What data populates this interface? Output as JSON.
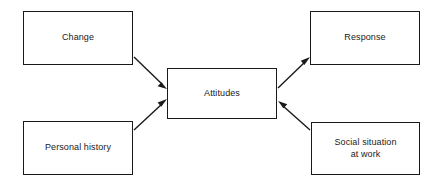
{
  "diagram": {
    "canvas": {
      "width": 443,
      "height": 184,
      "background": "#ffffff"
    },
    "style": {
      "box_border_color": "#1a1a1a",
      "box_fill": "#ffffff",
      "text_color": "#1a1a1a",
      "arrow_color": "#1a1a1a"
    },
    "nodes": [
      {
        "id": "change",
        "label": "Change",
        "x": 23,
        "y": 11,
        "width": 110,
        "height": 54
      },
      {
        "id": "personal_history",
        "label": "Personal history",
        "x": 23,
        "y": 121,
        "width": 110,
        "height": 54
      },
      {
        "id": "attitudes",
        "label": "Attitudes",
        "x": 167,
        "y": 68,
        "width": 110,
        "height": 51
      },
      {
        "id": "response",
        "label": "Response",
        "x": 310,
        "y": 11,
        "width": 110,
        "height": 54
      },
      {
        "id": "social_situation",
        "label": "Social situation\nat work",
        "x": 311,
        "y": 122,
        "width": 109,
        "height": 53
      }
    ],
    "edges": [
      {
        "id": "change-to-attitudes",
        "from": "change",
        "to": "attitudes",
        "label": ""
      },
      {
        "id": "personal-history-to-attitudes",
        "from": "personal_history",
        "to": "attitudes",
        "label": ""
      },
      {
        "id": "attitudes-to-response",
        "from": "attitudes",
        "to": "response",
        "label": ""
      },
      {
        "id": "social-situation-to-attitudes",
        "from": "social_situation",
        "to": "attitudes",
        "label": ""
      }
    ]
  }
}
